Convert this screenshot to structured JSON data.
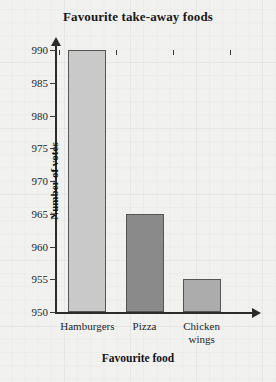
{
  "chart_data": {
    "type": "bar",
    "title": "Favourite take-away foods",
    "xlabel": "Favourite food",
    "ylabel": "Number of votes",
    "categories": [
      "Hamburgers",
      "Pizza",
      "Chicken\nwings"
    ],
    "values": [
      990,
      965,
      955
    ],
    "ylim": [
      950,
      990
    ],
    "ytick_step": 5,
    "yticks": [
      950,
      955,
      960,
      965,
      970,
      975,
      980,
      985,
      990
    ],
    "ytick_labels": [
      "950",
      "955",
      "960",
      "965",
      "970",
      "975",
      "980",
      "985",
      "990"
    ],
    "grid": true,
    "legend": null,
    "bar_colors": [
      "#c9c9c9",
      "#8a8a8a",
      "#abacab"
    ],
    "bar_border_color": "#555555",
    "axis_color": "#2b2b2b",
    "background_color": "#ebebea"
  }
}
